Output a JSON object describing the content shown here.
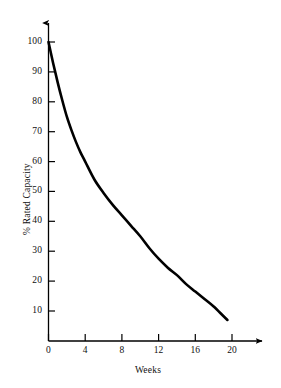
{
  "chart_data": {
    "type": "line",
    "title": "",
    "subtitle": "",
    "xlabel": "Weeks",
    "ylabel": "% Rated Capacity",
    "xlim": [
      0,
      24
    ],
    "ylim": [
      0,
      105
    ],
    "grid": false,
    "legend": null,
    "x_ticks": [
      0,
      4,
      8,
      12,
      16,
      20
    ],
    "x_tick_labels": [
      "0",
      "4",
      "8",
      "12",
      "16",
      "20"
    ],
    "y_ticks": [
      10,
      20,
      30,
      40,
      50,
      60,
      70,
      80,
      90,
      100
    ],
    "y_tick_labels": [
      "10",
      "20",
      "30",
      "40",
      "50",
      "60",
      "70",
      "80",
      "90",
      "100"
    ],
    "axis_style": {
      "x_axis_arrow": true,
      "y_axis_arrow": true,
      "tick_direction": "inward",
      "line_color": "#000000",
      "curve_color": "#000000",
      "curve_width_px": 2.6
    },
    "series": [
      {
        "name": "% Rated Capacity",
        "x": [
          0,
          0.5,
          1,
          1.5,
          2,
          2.5,
          3,
          3.5,
          4,
          5,
          6,
          7,
          8,
          9,
          10,
          11,
          12,
          13,
          14,
          15,
          16,
          17,
          18,
          19,
          19.5
        ],
        "values": [
          100,
          93,
          86.5,
          80.5,
          75,
          70.5,
          66.5,
          63,
          60,
          54,
          49.5,
          45.5,
          42,
          38.5,
          35,
          31,
          27.5,
          24.5,
          22,
          19,
          16.5,
          14,
          11.5,
          8.5,
          7
        ]
      }
    ],
    "annotations": []
  },
  "axis_titles": {
    "x": "Weeks",
    "y": "% Rated Capacity"
  }
}
